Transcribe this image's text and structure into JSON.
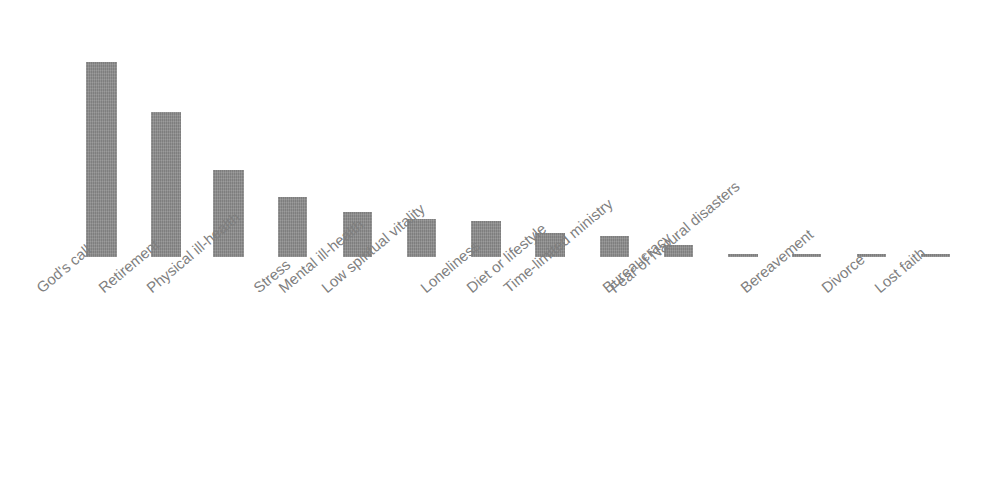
{
  "chart_data": {
    "type": "bar",
    "title": "",
    "subtitle": "",
    "xlabel": "",
    "ylabel": "Relative Importance",
    "orientation": "vertical",
    "grid": false,
    "legend": false,
    "legend_position": "none",
    "axis_tick_labels_y": [],
    "axis_tick_labels_x": [
      "God's call",
      "Retirement",
      "Physical ill-health",
      "Stress",
      "Mental ill-health",
      "Low spiritual vitality",
      "Loneliness",
      "Diet or lifestyle",
      "Time-limited ministry",
      "Bureaucracy",
      "Fear of Natural disasters",
      "Bereavement",
      "Divorce",
      "Lost faith"
    ],
    "x_tick_rotation_deg": -40,
    "ylim": [
      0,
      1.0
    ],
    "bar_color": "#8a8a8a",
    "label_color": "#7f7f7f",
    "axis_title_color": "#595959",
    "background_color": "#ffffff",
    "categories": [
      "God's call",
      "Retirement",
      "Physical ill-health",
      "Stress",
      "Mental ill-health",
      "Low spiritual vitality",
      "Loneliness",
      "Diet or lifestyle",
      "Time-limited ministry",
      "Bureaucracy",
      "Fear of Natural disasters",
      "Bereavement",
      "Divorce",
      "Lost faith"
    ],
    "values": [
      1.0,
      0.744,
      0.446,
      0.308,
      0.231,
      0.195,
      0.185,
      0.123,
      0.108,
      0.062,
      0.015,
      0.013,
      0.013,
      0.013
    ]
  },
  "bars": [
    {
      "label": "God's call",
      "value": 1.0,
      "x": 86,
      "width": 31,
      "top": 62,
      "height": 195
    },
    {
      "label": "Retirement",
      "value": 0.744,
      "x": 151,
      "width": 30,
      "top": 112,
      "height": 145
    },
    {
      "label": "Physical ill-health",
      "value": 0.446,
      "x": 213,
      "width": 31,
      "top": 170,
      "height": 87
    },
    {
      "label": "Stress",
      "value": 0.308,
      "x": 278,
      "width": 29,
      "top": 197,
      "height": 60
    },
    {
      "label": "Mental ill-health",
      "value": 0.231,
      "x": 343,
      "width": 29,
      "top": 212,
      "height": 45
    },
    {
      "label": "Low spiritual vitality",
      "value": 0.195,
      "x": 407,
      "width": 29,
      "top": 219,
      "height": 38
    },
    {
      "label": "Loneliness",
      "value": 0.185,
      "x": 471,
      "width": 30,
      "top": 221,
      "height": 36
    },
    {
      "label": "Diet or lifestyle",
      "value": 0.123,
      "x": 535,
      "width": 30,
      "top": 233,
      "height": 24
    },
    {
      "label": "Time-limited ministry",
      "value": 0.108,
      "x": 600,
      "width": 29,
      "top": 236,
      "height": 21
    },
    {
      "label": "Bureaucracy",
      "value": 0.062,
      "x": 664,
      "width": 29,
      "top": 245,
      "height": 12
    },
    {
      "label": "Fear of Natural disasters",
      "value": 0.015,
      "x": 728,
      "width": 30,
      "top": 254,
      "height": 3
    },
    {
      "label": "Bereavement",
      "value": 0.013,
      "x": 792,
      "width": 29,
      "top": 254,
      "height": 3
    },
    {
      "label": "Divorce",
      "value": 0.013,
      "x": 857,
      "width": 29,
      "top": 254,
      "height": 3
    },
    {
      "label": "Lost faith",
      "value": 0.013,
      "x": 921,
      "width": 29,
      "top": 254,
      "height": 3
    }
  ],
  "x_labels": [
    {
      "text": "God's call",
      "x": 33,
      "y": 283
    },
    {
      "text": "Retirement",
      "x": 95,
      "y": 283
    },
    {
      "text": "Physical ill-health",
      "x": 143,
      "y": 283
    },
    {
      "text": "Stress",
      "x": 250,
      "y": 283
    },
    {
      "text": "Mental ill-health",
      "x": 275,
      "y": 283
    },
    {
      "text": "Low spiritual vitality",
      "x": 318,
      "y": 283
    },
    {
      "text": "Loneliness",
      "x": 417,
      "y": 283
    },
    {
      "text": "Diet or lifestyle",
      "x": 463,
      "y": 283
    },
    {
      "text": "Time-limited ministry",
      "x": 500,
      "y": 283
    },
    {
      "text": "Bureaucracy",
      "x": 599,
      "y": 283
    },
    {
      "text": "Fear of Natural disasters",
      "x": 606,
      "y": 283
    },
    {
      "text": "Bereavement",
      "x": 737,
      "y": 283
    },
    {
      "text": "Divorce",
      "x": 818,
      "y": 283
    },
    {
      "text": "Lost faith",
      "x": 871,
      "y": 283
    }
  ]
}
